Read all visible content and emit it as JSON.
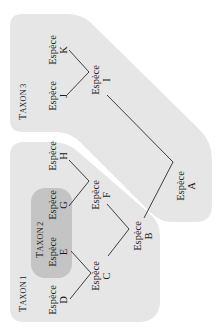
{
  "diagram": {
    "type": "phylogenetic-tree",
    "orientation": "rotated-90",
    "colors": {
      "background": "#ffffff",
      "taxon_region": "#e6e6e6",
      "taxon2_region": "#c4c4c4",
      "line": "#2a2a2a",
      "text": "#1a1a1a"
    },
    "taxa": [
      {
        "id": "taxon1",
        "label_initial": "T",
        "label_rest": "AXON",
        "number": "1"
      },
      {
        "id": "taxon2",
        "label_initial": "T",
        "label_rest": "AXON",
        "number": "2"
      },
      {
        "id": "taxon3",
        "label_initial": "T",
        "label_rest": "AXON",
        "number": "3"
      }
    ],
    "species": [
      {
        "id": "A",
        "word": "Espèce",
        "letter": "A"
      },
      {
        "id": "B",
        "word": "Espèce",
        "letter": "B"
      },
      {
        "id": "C",
        "word": "Espèce",
        "letter": "C"
      },
      {
        "id": "D",
        "word": "Espèce",
        "letter": "D"
      },
      {
        "id": "E",
        "word": "Espèce",
        "letter": "E"
      },
      {
        "id": "F",
        "word": "Espèce",
        "letter": "F"
      },
      {
        "id": "G",
        "word": "Espèce",
        "letter": "G"
      },
      {
        "id": "H",
        "word": "Espèce",
        "letter": "H"
      },
      {
        "id": "I",
        "word": "Espèce",
        "letter": "I"
      },
      {
        "id": "J",
        "word": "Espèce",
        "letter": "J"
      },
      {
        "id": "K",
        "word": "Espèce",
        "letter": "K"
      }
    ],
    "edges": [
      [
        "I",
        "K"
      ],
      [
        "I",
        "J"
      ],
      [
        "A",
        "I"
      ],
      [
        "F",
        "H"
      ],
      [
        "F",
        "G"
      ],
      [
        "C",
        "E"
      ],
      [
        "C",
        "D"
      ],
      [
        "B",
        "F"
      ],
      [
        "B",
        "C"
      ],
      [
        "A",
        "B"
      ]
    ]
  }
}
